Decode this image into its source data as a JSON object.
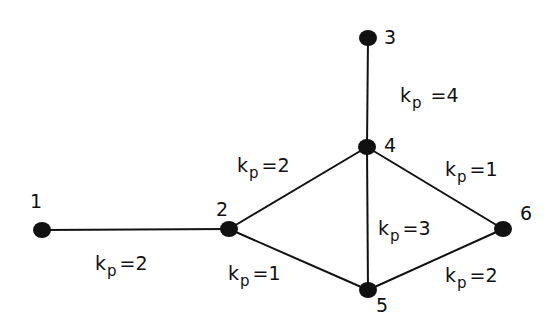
{
  "diagram": {
    "type": "network-graph",
    "nodes": [
      {
        "id": "1",
        "label": "1",
        "x": 42,
        "y": 230,
        "lx": 30,
        "ly": 208
      },
      {
        "id": "2",
        "label": "2",
        "x": 229,
        "y": 229,
        "lx": 216,
        "ly": 216
      },
      {
        "id": "3",
        "label": "3",
        "x": 368,
        "y": 38,
        "lx": 384,
        "ly": 44
      },
      {
        "id": "4",
        "label": "4",
        "x": 367,
        "y": 147,
        "lx": 384,
        "ly": 152
      },
      {
        "id": "5",
        "label": "5",
        "x": 368,
        "y": 290,
        "lx": 376,
        "ly": 312
      },
      {
        "id": "6",
        "label": "6",
        "x": 503,
        "y": 229,
        "lx": 520,
        "ly": 220
      }
    ],
    "edges": [
      {
        "from": "1",
        "to": "2",
        "label_k": "k",
        "label_sub": "p",
        "label_val": "=2",
        "lx": 95,
        "ly": 270
      },
      {
        "from": "2",
        "to": "4",
        "label_k": "k",
        "label_sub": "p",
        "label_val": "=2",
        "lx": 237,
        "ly": 172
      },
      {
        "from": "2",
        "to": "5",
        "label_k": "k",
        "label_sub": "p",
        "label_val": "=1",
        "lx": 228,
        "ly": 280
      },
      {
        "from": "3",
        "to": "4",
        "label_k": "k",
        "label_sub": "p",
        "label_val": " =4",
        "lx": 400,
        "ly": 102
      },
      {
        "from": "4",
        "to": "5",
        "label_k": "k",
        "label_sub": "p",
        "label_val": "=3",
        "lx": 378,
        "ly": 235
      },
      {
        "from": "4",
        "to": "6",
        "label_k": "k",
        "label_sub": "p",
        "label_val": "=1",
        "lx": 445,
        "ly": 176
      },
      {
        "from": "5",
        "to": "6",
        "label_k": "k",
        "label_sub": "p",
        "label_val": "=2",
        "lx": 445,
        "ly": 282
      }
    ]
  }
}
